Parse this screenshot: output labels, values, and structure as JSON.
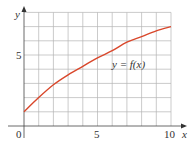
{
  "chart_data": {
    "type": "line",
    "title": "",
    "xlabel": "x",
    "ylabel": "y",
    "xlim": [
      0,
      10
    ],
    "ylim": [
      0,
      8
    ],
    "grid": true,
    "x_ticks": [
      "0",
      "5",
      "10"
    ],
    "y_ticks": [
      "5"
    ],
    "series": [
      {
        "name": "y = f(x)",
        "color": "#d9472b",
        "x": [
          0,
          1,
          2,
          3,
          4,
          5,
          6,
          7,
          8,
          9,
          10
        ],
        "values": [
          1,
          2,
          2.9,
          3.6,
          4.2,
          4.8,
          5.3,
          5.9,
          6.3,
          6.7,
          7
        ]
      }
    ],
    "annotations": [
      {
        "text": "y = f(x)",
        "x": 6,
        "y": 4.8
      }
    ]
  },
  "labels": {
    "x_axis": "x",
    "y_axis": "y",
    "tick_origin": "0",
    "tick_x5": "5",
    "tick_x10": "10",
    "tick_y5": "5",
    "curve_label": "y = f(x)"
  }
}
